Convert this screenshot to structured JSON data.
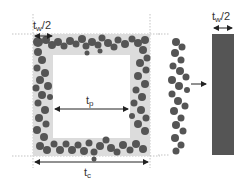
{
  "diagram": {
    "labels": {
      "half_wall_left": {
        "main": "t",
        "sub": "w",
        "suffix": "/2"
      },
      "pore": {
        "main": "t",
        "sub": "p"
      },
      "cell": {
        "main": "t",
        "sub": "c"
      },
      "half_wall_right": {
        "main": "t",
        "sub": "w",
        "suffix": "/2"
      }
    },
    "colors": {
      "particle": "#555555",
      "wall_band": "#dddddd",
      "bar": "#555555",
      "guide": "#999999",
      "arrow": "#222222"
    }
  }
}
